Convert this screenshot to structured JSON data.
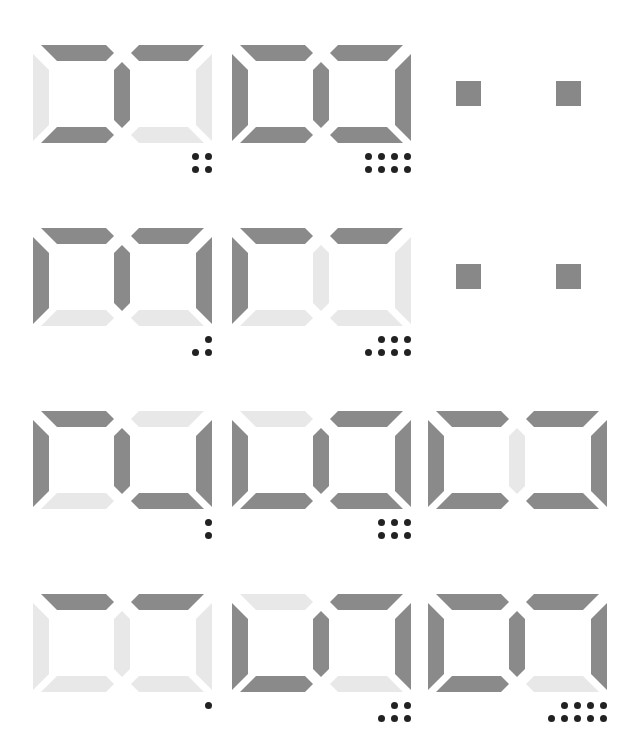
{
  "colors": {
    "segment_on": "#8a8a8a",
    "segment_off": "#e8e8e8",
    "dot": "#222222",
    "square": "#888888"
  },
  "segment_order": [
    "top_left",
    "top_right",
    "left",
    "middle",
    "right",
    "bottom_left",
    "bottom_right"
  ],
  "rows": [
    {
      "glyphs": [
        {
          "segments": [
            1,
            1,
            0,
            1,
            0,
            1,
            0
          ],
          "dots": {
            "top": 2,
            "bottom": 2
          }
        },
        {
          "segments": [
            1,
            1,
            1,
            1,
            1,
            1,
            1
          ],
          "dots": {
            "top": 4,
            "bottom": 4
          }
        }
      ],
      "squares": 2
    },
    {
      "glyphs": [
        {
          "segments": [
            1,
            1,
            1,
            1,
            1,
            0,
            0
          ],
          "dots": {
            "top": 1,
            "bottom": 2
          }
        },
        {
          "segments": [
            1,
            1,
            1,
            0,
            0,
            0,
            0
          ],
          "dots": {
            "top": 3,
            "bottom": 4
          }
        }
      ],
      "squares": 2
    },
    {
      "glyphs": [
        {
          "segments": [
            1,
            0,
            1,
            1,
            1,
            0,
            1
          ],
          "dots": {
            "top": 1,
            "bottom": 1
          }
        },
        {
          "segments": [
            0,
            1,
            1,
            1,
            1,
            1,
            1
          ],
          "dots": {
            "top": 3,
            "bottom": 3
          }
        },
        {
          "segments": [
            1,
            1,
            1,
            0,
            1,
            1,
            1
          ],
          "dots": {
            "top": 0,
            "bottom": 0
          }
        }
      ],
      "squares": 0
    },
    {
      "glyphs": [
        {
          "segments": [
            1,
            1,
            0,
            0,
            0,
            0,
            0
          ],
          "dots": {
            "top": 1,
            "bottom": 0
          }
        },
        {
          "segments": [
            0,
            1,
            1,
            1,
            1,
            1,
            0
          ],
          "dots": {
            "top": 2,
            "bottom": 3
          }
        },
        {
          "segments": [
            1,
            1,
            1,
            1,
            1,
            1,
            0
          ],
          "dots": {
            "top": 4,
            "bottom": 5
          }
        }
      ],
      "squares": 0
    }
  ]
}
